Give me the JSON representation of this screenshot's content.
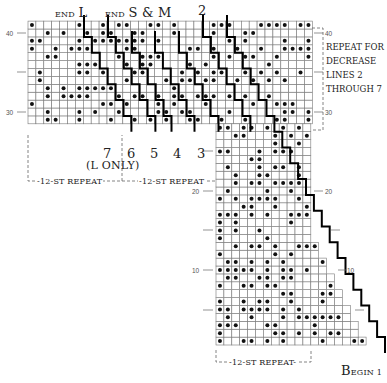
{
  "labels": {
    "end_l_small": "END",
    "end_l_big": "L",
    "end_sm_small": "END",
    "end_sm_big": "S & M",
    "top_2": "2",
    "bottom_7": "7",
    "l_only": "(L ONLY)",
    "bottom_6": "6",
    "bottom_5": "5",
    "bottom_4": "4",
    "bottom_3": "3",
    "repeat_left": "-12-ST REPEAT",
    "repeat_mid": "-12-ST REPEAT",
    "repeat_bottom": "-12-ST REPEAT-",
    "begin_small": "B",
    "begin_rest": "EGIN 1",
    "note_lines": [
      "REPEAT FOR",
      "DECREASE",
      "LINES 2",
      "THROUGH 7"
    ]
  },
  "row_ticks": {
    "left": [
      "40",
      "30",
      "20",
      "10"
    ],
    "right": [
      "40",
      "30",
      "20",
      "10"
    ]
  },
  "colors": {
    "grid": "#777777",
    "stitch": "#111111",
    "line": "#000000",
    "dash": "#666666"
  },
  "chart_data": {
    "type": "knitting-chart",
    "rows": 41,
    "cell_px": 7.9,
    "top_block": {
      "cols": 36,
      "rows_from": 29,
      "rows_to": 41
    },
    "bottom_block": {
      "cols_min": 12,
      "cols_max": 19,
      "rows_from": 1,
      "rows_to": 28
    },
    "decrease_lines": [
      "2",
      "3",
      "4",
      "5",
      "6",
      "7 (L only)"
    ],
    "repeat": "12-st repeat",
    "symbol": "dot = contrast stitch"
  }
}
